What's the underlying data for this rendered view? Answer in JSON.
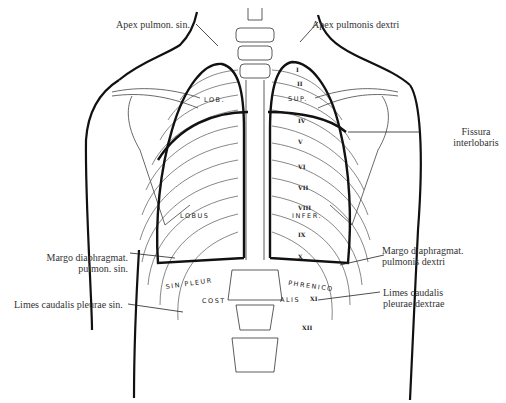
{
  "figure": {
    "labels": {
      "apex_left": "Apex pulmon. sin.",
      "apex_right": "Apex pulmonis dextri",
      "fissura_line1": "Fissura",
      "fissura_line2": "interlobaris",
      "margo_left_line1": "Margo diaphragmat.",
      "margo_left_line2": "pulmon. sin.",
      "margo_right_line1": "Margo diaphragmat.",
      "margo_right_line2": "pulmonis dextri",
      "limes_left": "Limes caudalis pleurae sin.",
      "limes_right_line1": "Limes caudalis",
      "limes_right_line2": "pleurae dextrae"
    },
    "inline_tags": {
      "lob": "LOB.",
      "sup": "SUP.",
      "lobus": "LOBUS",
      "infer": "INFER.",
      "sin_pleur": "SIN PLEUR",
      "cost": "COST",
      "phrenico": "PHRENICO",
      "alis": "ALIS"
    },
    "rib_numerals": [
      "I",
      "II",
      "IV",
      "V",
      "VI",
      "VII",
      "VIII",
      "IX",
      "X",
      "XI",
      "XII"
    ],
    "colors": {
      "ink": "#111111",
      "fine_line": "#444444",
      "background": "#ffffff"
    }
  }
}
